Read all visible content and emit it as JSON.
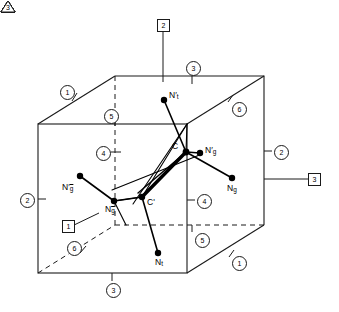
{
  "diagram": {
    "background": "#ffffff",
    "line_color": "#1a1a1a",
    "node_color": "#000000"
  },
  "nodes": [
    {
      "id": "C",
      "label": "C",
      "x": 186,
      "y": 152,
      "lx": 172,
      "ly": 142
    },
    {
      "id": "Cp",
      "label": "C'",
      "x": 142,
      "y": 197,
      "lx": 147,
      "ly": 198
    },
    {
      "id": "Nt",
      "label": "N",
      "sub": "t",
      "prime": true,
      "overline": false,
      "x": 164,
      "y": 100,
      "lx": 169,
      "ly": 93
    },
    {
      "id": "Ngp",
      "label": "N",
      "sub": "g",
      "prime": true,
      "overline": false,
      "x": 200,
      "y": 153,
      "lx": 205,
      "ly": 147
    },
    {
      "id": "Ng",
      "label": "N",
      "sub": "g",
      "prime": false,
      "overline": false,
      "x": 232,
      "y": 178,
      "lx": 228,
      "ly": 184
    },
    {
      "id": "Ngbp",
      "label": "N",
      "sub": "g",
      "prime": true,
      "overline": true,
      "x": 80,
      "y": 176,
      "lx": 64,
      "ly": 183
    },
    {
      "id": "Ngb",
      "label": "N",
      "sub": "g",
      "prime": false,
      "overline": true,
      "x": 114,
      "y": 201,
      "lx": 108,
      "ly": 205
    },
    {
      "id": "Ntb",
      "label": "N",
      "sub": "t",
      "prime": false,
      "overline": false,
      "x": 158,
      "y": 253,
      "lx": 156,
      "ly": 258
    }
  ],
  "markers": {
    "circled": [
      {
        "n": "1",
        "x": 66,
        "y": 91
      },
      {
        "n": "5",
        "x": 110,
        "y": 115
      },
      {
        "n": "3",
        "x": 192,
        "y": 67
      },
      {
        "n": "6",
        "x": 238,
        "y": 108
      },
      {
        "n": "2",
        "x": 312,
        "y": 151
      },
      {
        "n": "4",
        "x": 109,
        "y": 152
      },
      {
        "n": "2",
        "x": 26,
        "y": 199
      },
      {
        "n": "4",
        "x": 199,
        "y": 200
      },
      {
        "n": "5",
        "x": 201,
        "y": 236
      },
      {
        "n": "6",
        "x": 73,
        "y": 247
      },
      {
        "n": "3",
        "x": 112,
        "y": 288
      },
      {
        "n": "1",
        "x": 238,
        "y": 262
      }
    ],
    "boxed": [
      {
        "n": "2",
        "x": 157,
        "y": 20
      },
      {
        "n": "3",
        "x": 315,
        "y": 179
      },
      {
        "n": "1",
        "x": 62,
        "y": 226
      }
    ],
    "triangles": [
      {
        "n": "3",
        "x": 114,
        "y": 66
      },
      {
        "n": "4",
        "x": 278,
        "y": 61
      },
      {
        "n": "2",
        "x": 22,
        "y": 125
      },
      {
        "n": "1",
        "x": 184,
        "y": 119
      },
      {
        "n": "1",
        "x": 111,
        "y": 228
      },
      {
        "n": "2",
        "x": 285,
        "y": 238
      },
      {
        "n": "4",
        "x": 31,
        "y": 290
      },
      {
        "n": "3",
        "x": 186,
        "y": 290
      }
    ]
  },
  "geometry": {
    "cube": {
      "front": [
        [
          38,
          124
        ],
        [
          187,
          124
        ],
        [
          187,
          273
        ],
        [
          38,
          273
        ]
      ],
      "back": [
        [
          115,
          76
        ],
        [
          264,
          76
        ],
        [
          264,
          225
        ],
        [
          115,
          225
        ]
      ]
    },
    "bonds": [
      {
        "from": "Nt",
        "to": "C",
        "weight": "thin"
      },
      {
        "from": "Ngp",
        "to": "C",
        "weight": "thin"
      },
      {
        "from": "C",
        "to": "Ng",
        "weight": "thin"
      },
      {
        "from": "C",
        "to": "Cp",
        "weight": "thick"
      },
      {
        "from": "Ngbp",
        "to": "Ngb",
        "weight": "thin"
      },
      {
        "from": "Ngb",
        "to": "Cp",
        "weight": "thin"
      },
      {
        "from": "Cp",
        "to": "Ntb",
        "weight": "thin"
      }
    ]
  },
  "leaders": [
    {
      "name": "leader-boxed-2",
      "from": [
        163,
        30
      ],
      "to": [
        163,
        82
      ]
    },
    {
      "name": "leader-boxed-3",
      "from": [
        308,
        179
      ],
      "to": [
        264,
        179
      ]
    },
    {
      "name": "leader-boxed-1",
      "from": [
        72,
        226
      ],
      "to": [
        97,
        214
      ]
    }
  ]
}
